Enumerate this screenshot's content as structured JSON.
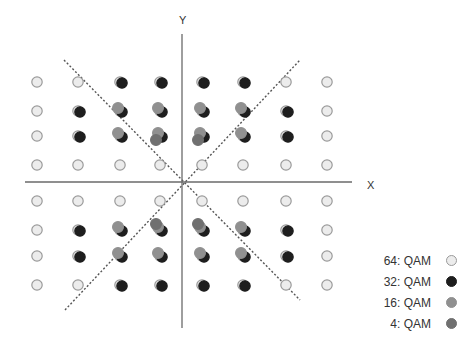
{
  "diagram": {
    "axes": {
      "x_label": "X",
      "y_label": "Y"
    },
    "legend": [
      {
        "label": "64: QAM",
        "fill": "#ececec",
        "stroke": "#9a9a9a"
      },
      {
        "label": "32: QAM",
        "fill": "#1e1e1e",
        "stroke": "#1e1e1e"
      },
      {
        "label": "16: QAM",
        "fill": "#909090",
        "stroke": "#909090"
      },
      {
        "label": "4: QAM",
        "fill": "#707070",
        "stroke": "#707070"
      }
    ]
  },
  "chart_data": {
    "type": "scatter",
    "title": "",
    "xlabel": "X",
    "ylabel": "Y",
    "grid": false,
    "legend_position": "bottom-right",
    "grid_levels": [
      -7,
      -5,
      -3,
      -1,
      1,
      3,
      5,
      7
    ],
    "series": [
      {
        "name": "64: QAM",
        "points": "all 64 points (x,y) with x,y in {-7,-5,-3,-1,1,3,5,7}"
      },
      {
        "name": "32: QAM",
        "points": [
          [
            -3,
            7
          ],
          [
            -1,
            7
          ],
          [
            1,
            7
          ],
          [
            3,
            7
          ],
          [
            -5,
            5
          ],
          [
            -3,
            5
          ],
          [
            -1,
            5
          ],
          [
            1,
            5
          ],
          [
            3,
            5
          ],
          [
            5,
            5
          ],
          [
            -5,
            3
          ],
          [
            -3,
            3
          ],
          [
            -1,
            3
          ],
          [
            1,
            3
          ],
          [
            3,
            3
          ],
          [
            5,
            3
          ],
          [
            -5,
            -3
          ],
          [
            -3,
            -3
          ],
          [
            -1,
            -3
          ],
          [
            1,
            -3
          ],
          [
            3,
            -3
          ],
          [
            5,
            -3
          ],
          [
            -5,
            -5
          ],
          [
            -3,
            -5
          ],
          [
            -1,
            -5
          ],
          [
            1,
            -5
          ],
          [
            3,
            -5
          ],
          [
            5,
            -5
          ],
          [
            -3,
            -7
          ],
          [
            -1,
            -7
          ],
          [
            1,
            -7
          ],
          [
            3,
            -7
          ]
        ]
      },
      {
        "name": "16: QAM",
        "points": [
          [
            -3,
            5
          ],
          [
            -1,
            5
          ],
          [
            1,
            5
          ],
          [
            3,
            5
          ],
          [
            -3,
            3
          ],
          [
            -1,
            3
          ],
          [
            1,
            3
          ],
          [
            3,
            3
          ],
          [
            -3,
            -3
          ],
          [
            -1,
            -3
          ],
          [
            1,
            -3
          ],
          [
            3,
            -3
          ],
          [
            -3,
            -5
          ],
          [
            -1,
            -5
          ],
          [
            1,
            -5
          ],
          [
            3,
            -5
          ]
        ]
      },
      {
        "name": "4: QAM",
        "points": [
          [
            -1,
            3
          ],
          [
            1,
            3
          ],
          [
            -1,
            -3
          ],
          [
            1,
            -3
          ]
        ]
      }
    ],
    "annotations": [
      "dotted diagonal lines y = x and y = -x through the origin"
    ]
  }
}
